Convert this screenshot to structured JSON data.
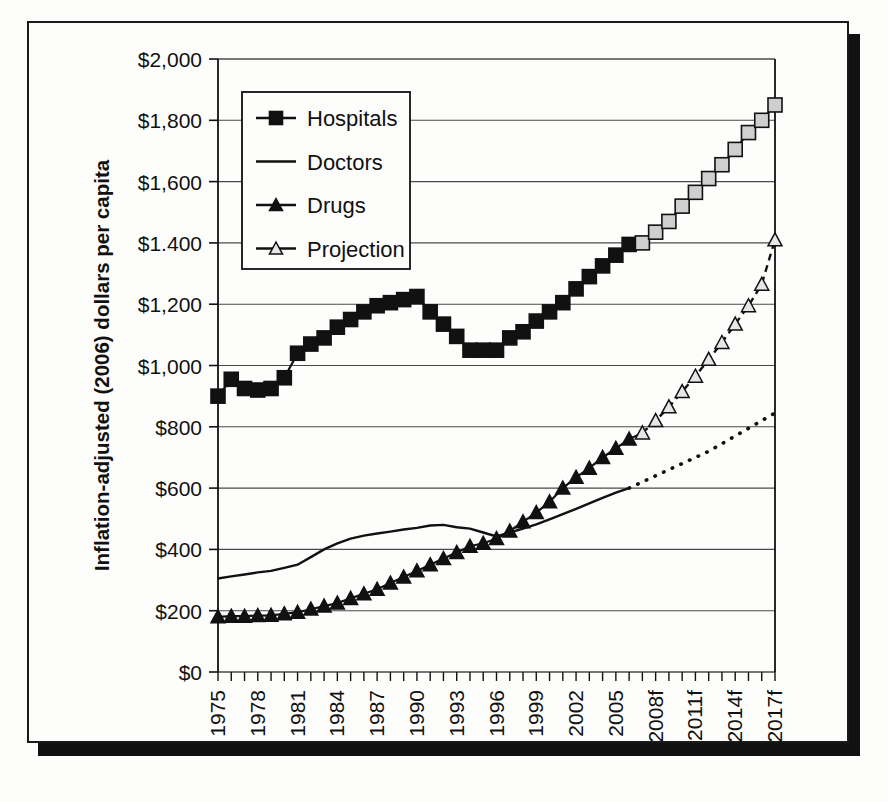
{
  "figure": {
    "frame_color": "#1a1a1a",
    "shadow_color": "#111111",
    "background": "#fdfdfc"
  },
  "axis": {
    "y_title": "Inflation-adjusted (2006) dollars per capita",
    "y_ticks": [
      "$0",
      "$200",
      "$400",
      "$600",
      "$800",
      "$1,000",
      "$1,200",
      "$1.400",
      "$1,600",
      "$1,800",
      "$2,000"
    ],
    "x_ticks": [
      "1975",
      "1978",
      "1981",
      "1984",
      "1987",
      "1990",
      "1993",
      "1996",
      "1999",
      "2002",
      "2005",
      "2008f",
      "2011f",
      "2014f",
      "2017f"
    ]
  },
  "legend": {
    "items": [
      {
        "label": "Hospitals",
        "marker": "filled-square",
        "color": "#111111"
      },
      {
        "label": "Doctors",
        "marker": "line",
        "color": "#111111"
      },
      {
        "label": "Drugs",
        "marker": "filled-triangle",
        "color": "#111111"
      },
      {
        "label": "Projection",
        "marker": "open-triangle",
        "color": "#111111"
      }
    ]
  },
  "chart_data": {
    "type": "line",
    "title": "",
    "xlabel": "",
    "ylabel": "Inflation-adjusted (2006) dollars per capita",
    "xlim": [
      1975,
      2017
    ],
    "ylim": [
      0,
      2000
    ],
    "ytick_values": [
      0,
      200,
      400,
      600,
      800,
      1000,
      1200,
      1400,
      1600,
      1800,
      2000
    ],
    "xtick_values": [
      1975,
      1978,
      1981,
      1984,
      1987,
      1990,
      1993,
      1996,
      1999,
      2002,
      2005,
      2008,
      2011,
      2014,
      2017
    ],
    "xtick_labels": [
      "1975",
      "1978",
      "1981",
      "1984",
      "1987",
      "1990",
      "1993",
      "1996",
      "1999",
      "2002",
      "2005",
      "2008f",
      "2011f",
      "2014f",
      "2017f"
    ],
    "grid": "horizontal",
    "legend_position": "upper-left-inside",
    "projection_starts": 2007,
    "x": [
      1975,
      1976,
      1977,
      1978,
      1979,
      1980,
      1981,
      1982,
      1983,
      1984,
      1985,
      1986,
      1987,
      1988,
      1989,
      1990,
      1991,
      1992,
      1993,
      1994,
      1995,
      1996,
      1997,
      1998,
      1999,
      2000,
      2001,
      2002,
      2003,
      2004,
      2005,
      2006,
      2007,
      2008,
      2009,
      2010,
      2011,
      2012,
      2013,
      2014,
      2015,
      2016,
      2017
    ],
    "series": [
      {
        "name": "Hospitals",
        "marker": "filled-square",
        "values": [
          900,
          955,
          925,
          920,
          925,
          960,
          1040,
          1070,
          1090,
          1125,
          1150,
          1175,
          1195,
          1205,
          1215,
          1225,
          1175,
          1135,
          1095,
          1050,
          1050,
          1050,
          1090,
          1110,
          1145,
          1175,
          1205,
          1250,
          1290,
          1325,
          1360,
          1395,
          1400,
          1435,
          1470,
          1520,
          1565,
          1610,
          1655,
          1705,
          1760,
          1800,
          1850
        ]
      },
      {
        "name": "Doctors",
        "marker": "line",
        "values": [
          305,
          312,
          318,
          325,
          330,
          340,
          350,
          375,
          400,
          420,
          435,
          445,
          452,
          458,
          465,
          470,
          478,
          480,
          472,
          468,
          455,
          442,
          455,
          468,
          482,
          498,
          515,
          532,
          550,
          568,
          585,
          600,
          620,
          640,
          660,
          680,
          700,
          720,
          745,
          770,
          795,
          820,
          845
        ]
      },
      {
        "name": "Drugs",
        "marker": "filled-triangle",
        "values": [
          180,
          182,
          182,
          184,
          185,
          190,
          195,
          205,
          215,
          225,
          240,
          255,
          270,
          290,
          310,
          330,
          350,
          370,
          390,
          410,
          420,
          435,
          460,
          490,
          520,
          555,
          600,
          635,
          665,
          700,
          730,
          760,
          780,
          820,
          865,
          915,
          965,
          1020,
          1075,
          1135,
          1195,
          1265,
          1410
        ]
      }
    ],
    "projection_series": [
      {
        "name": "Hospitals projection",
        "marker": "open-square",
        "x": [
          2007,
          2008,
          2009,
          2010,
          2011,
          2012,
          2013,
          2014,
          2015,
          2016,
          2017
        ],
        "values": [
          1400,
          1435,
          1470,
          1520,
          1565,
          1610,
          1655,
          1705,
          1760,
          1800,
          1850
        ]
      },
      {
        "name": "Drugs projection",
        "marker": "open-triangle",
        "x": [
          2007,
          2008,
          2009,
          2010,
          2011,
          2012,
          2013,
          2014,
          2015,
          2016,
          2017
        ],
        "values": [
          780,
          820,
          865,
          915,
          965,
          1020,
          1075,
          1135,
          1195,
          1265,
          1410
        ]
      },
      {
        "name": "Doctors projection",
        "marker": "dotted-line",
        "x": [
          2006,
          2007,
          2008,
          2009,
          2010,
          2011,
          2012,
          2013,
          2014,
          2015,
          2016,
          2017
        ],
        "values": [
          600,
          620,
          640,
          660,
          680,
          700,
          720,
          745,
          770,
          795,
          820,
          845
        ]
      }
    ]
  }
}
